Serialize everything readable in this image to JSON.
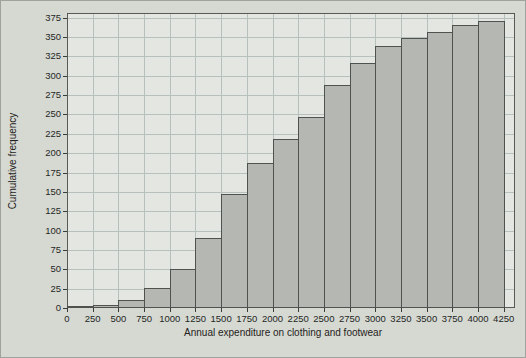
{
  "figure_title": "",
  "chart_data": {
    "type": "bar",
    "subtype": "cumulative-frequency-histogram",
    "title": "",
    "xlabel": "Annual expenditure on clothing and footwear",
    "ylabel": "Cumulative frequency",
    "bin_width": 250,
    "bin_edges": [
      0,
      250,
      500,
      750,
      1000,
      1250,
      1500,
      1750,
      2000,
      2250,
      2500,
      2750,
      3000,
      3250,
      3500,
      3750,
      4000,
      4250
    ],
    "categories": [
      "0-250",
      "250-500",
      "500-750",
      "750-1000",
      "1000-1250",
      "1250-1500",
      "1500-1750",
      "1750-2000",
      "2000-2250",
      "2250-2500",
      "2500-2750",
      "2750-3000",
      "3000-3250",
      "3250-3500",
      "3500-3750",
      "3750-4000",
      "4000-4250"
    ],
    "values": [
      2,
      4,
      10,
      26,
      51,
      90,
      147,
      187,
      218,
      247,
      288,
      317,
      339,
      349,
      357,
      366,
      371
    ],
    "x_ticks": [
      0,
      250,
      500,
      750,
      1000,
      1250,
      1500,
      1750,
      2000,
      2250,
      2500,
      2750,
      3000,
      3250,
      3500,
      3750,
      4000,
      4250
    ],
    "y_ticks": [
      0,
      25,
      50,
      75,
      100,
      125,
      150,
      175,
      200,
      225,
      250,
      275,
      300,
      325,
      350,
      375
    ],
    "xlim": [
      0,
      4360
    ],
    "ylim": [
      0,
      381
    ],
    "grid": true,
    "legend": false,
    "colors": {
      "figure_background": "#d6d9d2",
      "plot_background": "#e4e6e1",
      "gridline": "#b6c0bd",
      "bar_fill": "#b5b8b2",
      "bar_border": "#4e534f",
      "frame": "#565b57",
      "text": "#242725"
    }
  }
}
